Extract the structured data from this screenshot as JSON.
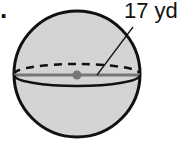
{
  "problem_number": ".",
  "figure": {
    "shape": "sphere",
    "radius_label": "17 yd",
    "fill_color": "#d4d4d4",
    "outline_color": "#111111",
    "radius_line_color": "#777777",
    "center_dot_color": "#777777"
  }
}
